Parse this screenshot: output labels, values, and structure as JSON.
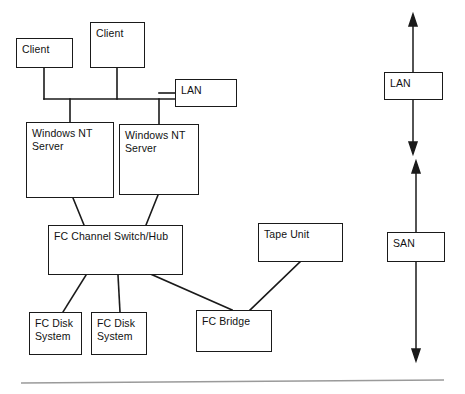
{
  "diagram": {
    "background_color": "#ffffff",
    "line_color": "#1a1a1a",
    "rule_color": "#9a9a9a",
    "nodes": [
      {
        "id": "client-1",
        "label": "Client",
        "x": 16,
        "y": 38,
        "w": 57,
        "h": 30
      },
      {
        "id": "client-2",
        "label": "Client",
        "x": 90,
        "y": 22,
        "w": 55,
        "h": 46
      },
      {
        "id": "lan-left",
        "label": "LAN",
        "x": 175,
        "y": 79,
        "w": 62,
        "h": 28
      },
      {
        "id": "nt-server-1",
        "label": "Windows NT\nServer",
        "x": 26,
        "y": 122,
        "w": 88,
        "h": 76
      },
      {
        "id": "nt-server-2",
        "label": "Windows NT\nServer",
        "x": 119,
        "y": 124,
        "w": 80,
        "h": 71
      },
      {
        "id": "fc-switch-hub",
        "label": "FC Channel Switch/Hub",
        "x": 48,
        "y": 225,
        "w": 135,
        "h": 50
      },
      {
        "id": "tape-unit",
        "label": "Tape Unit",
        "x": 258,
        "y": 223,
        "w": 85,
        "h": 39
      },
      {
        "id": "fc-disk-1",
        "label": "FC Disk\nSystem",
        "x": 29,
        "y": 312,
        "w": 53,
        "h": 43
      },
      {
        "id": "fc-disk-2",
        "label": "FC Disk\nSystem",
        "x": 91,
        "y": 312,
        "w": 56,
        "h": 43
      },
      {
        "id": "fc-bridge",
        "label": "FC Bridge",
        "x": 196,
        "y": 310,
        "w": 76,
        "h": 42
      },
      {
        "id": "lan-scope",
        "label": "LAN",
        "x": 384,
        "y": 72,
        "w": 59,
        "h": 28
      },
      {
        "id": "san-scope",
        "label": "SAN",
        "x": 387,
        "y": 232,
        "w": 58,
        "h": 30
      }
    ],
    "scope_arrows": [
      {
        "id": "lan-extent-arrow",
        "x": 413,
        "top": 18,
        "bottom": 150
      },
      {
        "id": "san-extent-arrow",
        "x": 416,
        "top": 165,
        "bottom": 357
      }
    ],
    "footer_rule": {
      "id": "footer-rule",
      "x1": 21,
      "y1": 383,
      "x2": 444,
      "y2": 380
    }
  }
}
